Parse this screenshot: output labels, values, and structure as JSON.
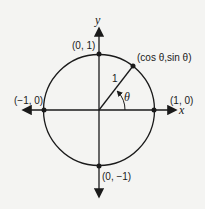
{
  "diagram": {
    "axes": {
      "x_label": "x",
      "y_label": "y"
    },
    "points": {
      "top": "(0, 1)",
      "bottom": "(0, −1)",
      "left": "(−1, 0)",
      "right": "(1, 0)",
      "general": "(cos θ,sin θ)"
    },
    "radius_label": "1",
    "angle_label": "θ",
    "colors": {
      "stroke": "#1a1a1a",
      "background": "#f4f4f2"
    }
  }
}
